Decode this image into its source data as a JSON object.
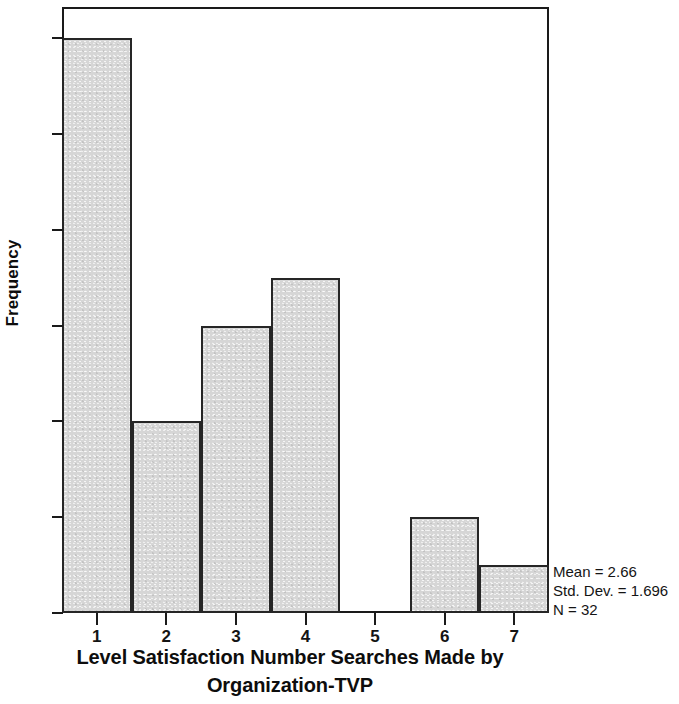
{
  "chart_data": {
    "type": "bar",
    "title": "",
    "subtitle": "",
    "xlabel_line1": "Level Satisfaction Number Searches Made by",
    "xlabel_line2": "Organization-TVP",
    "ylabel": "Frequency",
    "categories": [
      "1",
      "2",
      "3",
      "4",
      "5",
      "6",
      "7"
    ],
    "values": [
      12,
      4,
      6,
      7,
      0,
      2,
      1
    ],
    "xtick_labels": [
      "1",
      "2",
      "3",
      "4",
      "5",
      "6",
      "7"
    ],
    "ytick_labels": [
      "0",
      "2",
      "4",
      "6",
      "8",
      "10",
      "12"
    ],
    "ytick_values": [
      0,
      2,
      4,
      6,
      8,
      10,
      12
    ],
    "ylim": [
      0,
      12.65
    ],
    "xlim": [
      0.5,
      7.5
    ],
    "grid": false,
    "legend": null,
    "bar_fill_color": "#d6d6d6",
    "bar_edge_color": "#262626",
    "annotations": {
      "mean": "Mean = 2.66",
      "std_dev": "Std. Dev. = 1.696",
      "n": "N = 32"
    }
  }
}
